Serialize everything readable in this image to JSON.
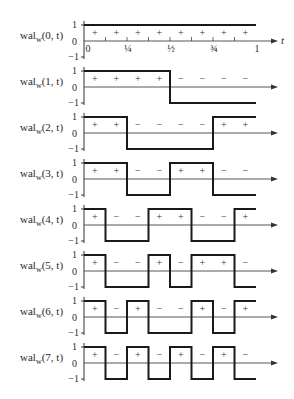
{
  "diagram": {
    "x_axis": {
      "label": "t",
      "ticks": [
        {
          "value": 0,
          "label": "0"
        },
        {
          "value": 0.25,
          "label": "¼"
        },
        {
          "value": 0.5,
          "label": "½"
        },
        {
          "value": 0.75,
          "label": "¾"
        },
        {
          "value": 1,
          "label": "1"
        }
      ]
    },
    "y_ticks": [
      "1",
      "0",
      "−1"
    ],
    "functions": [
      {
        "name": "wal",
        "subscript": "w",
        "args": "(0, t)",
        "signs": [
          "+",
          "+",
          "+",
          "+",
          "+",
          "+",
          "+",
          "+"
        ]
      },
      {
        "name": "wal",
        "subscript": "w",
        "args": "(1, t)",
        "signs": [
          "+",
          "+",
          "+",
          "+",
          "−",
          "−",
          "−",
          "−"
        ]
      },
      {
        "name": "wal",
        "subscript": "w",
        "args": "(2, t)",
        "signs": [
          "+",
          "+",
          "−",
          "−",
          "−",
          "−",
          "+",
          "+"
        ]
      },
      {
        "name": "wal",
        "subscript": "w",
        "args": "(3, t)",
        "signs": [
          "+",
          "+",
          "−",
          "−",
          "+",
          "+",
          "−",
          "−"
        ]
      },
      {
        "name": "wal",
        "subscript": "w",
        "args": "(4, t)",
        "signs": [
          "+",
          "−",
          "−",
          "+",
          "+",
          "−",
          "−",
          "+"
        ]
      },
      {
        "name": "wal",
        "subscript": "w",
        "args": "(5, t)",
        "signs": [
          "+",
          "−",
          "−",
          "+",
          "−",
          "+",
          "+",
          "−"
        ]
      },
      {
        "name": "wal",
        "subscript": "w",
        "args": "(6, t)",
        "signs": [
          "+",
          "−",
          "+",
          "−",
          "−",
          "+",
          "−",
          "+"
        ]
      },
      {
        "name": "wal",
        "subscript": "w",
        "args": "(7, t)",
        "signs": [
          "+",
          "−",
          "+",
          "−",
          "+",
          "−",
          "+",
          "−"
        ]
      }
    ]
  }
}
